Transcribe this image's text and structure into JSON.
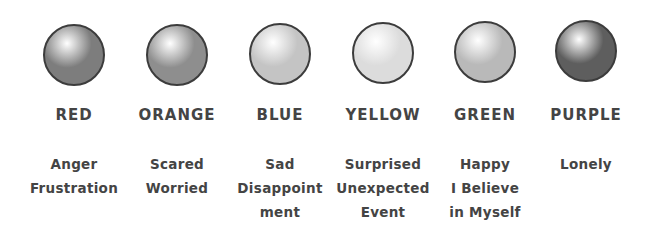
{
  "colors": [
    {
      "name": "RED",
      "emotions": [
        "Anger",
        "Frustration"
      ],
      "cx": 74,
      "cy": 55,
      "shade": "#7d7d7d",
      "highlight": "#ffffff"
    },
    {
      "name": "ORANGE",
      "emotions": [
        "Scared",
        "Worried"
      ],
      "cx": 177,
      "cy": 55,
      "shade": "#8e8e8e",
      "highlight": "#ffffff"
    },
    {
      "name": "BLUE",
      "emotions": [
        "Sad",
        "Disappoint",
        "ment"
      ],
      "cx": 280,
      "cy": 54,
      "shade": "#c4c4c4",
      "highlight": "#ffffff"
    },
    {
      "name": "YELLOW",
      "emotions": [
        "Surprised",
        "Unexpected",
        "Event"
      ],
      "cx": 383,
      "cy": 53,
      "shade": "#dcdcdc",
      "highlight": "#ffffff"
    },
    {
      "name": "GREEN",
      "emotions": [
        "Happy",
        "I Believe",
        "in Myself"
      ],
      "cx": 485,
      "cy": 52,
      "shade": "#b9b9b9",
      "highlight": "#ffffff"
    },
    {
      "name": "PURPLE",
      "emotions": [
        "Lonely"
      ],
      "cx": 586,
      "cy": 51,
      "shade": "#5e5e5e",
      "highlight": "#ffffff"
    }
  ]
}
